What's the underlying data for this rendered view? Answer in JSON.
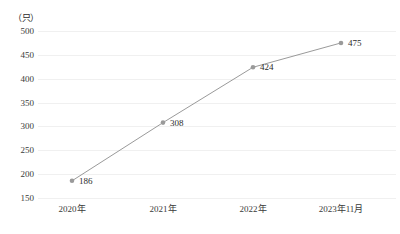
{
  "chart_data": {
    "type": "line",
    "title": "",
    "subtitle": "",
    "xlabel": "",
    "ylabel": "",
    "unit_label": "（只）",
    "categories": [
      "2020年",
      "2021年",
      "2022年",
      "2023年11月"
    ],
    "values": [
      186,
      308,
      424,
      475
    ],
    "point_labels": [
      "186",
      "308",
      "424",
      "475"
    ],
    "ylim": [
      150,
      500
    ],
    "ytick_values": [
      500,
      450,
      400,
      350,
      300,
      250,
      200,
      150
    ],
    "ytick_labels": [
      "500",
      "450",
      "400",
      "350",
      "300",
      "250",
      "200",
      "150"
    ],
    "grid": true,
    "grid_axis": "y",
    "legend": false,
    "legend_position": "none",
    "series": [
      {
        "name": "",
        "values": [
          186,
          308,
          424,
          475
        ],
        "line_color": "#9a9a9a",
        "marker_color": "#9a9a9a",
        "marker_shape": "circle"
      }
    ],
    "colors": {
      "line": "#9a9a9a",
      "marker": "#9a9a9a",
      "grid": "#f0f0f0",
      "text": "#2b2b2b",
      "background": "#ffffff"
    }
  }
}
